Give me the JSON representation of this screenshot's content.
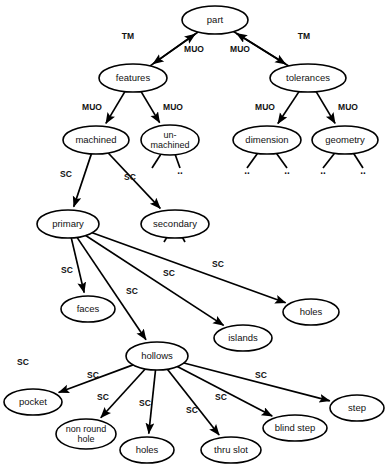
{
  "diagram": {
    "background_color": "#ffffff",
    "stroke_color": "#000000",
    "text_color": "#111111",
    "nodes": [
      {
        "id": "part",
        "label": "part",
        "cx": 215,
        "cy": 20,
        "rx": 33,
        "ry": 14
      },
      {
        "id": "features",
        "label": "features",
        "cx": 133,
        "cy": 78,
        "rx": 34,
        "ry": 14
      },
      {
        "id": "tolerances",
        "label": "tolerances",
        "cx": 308,
        "cy": 78,
        "rx": 38,
        "ry": 14
      },
      {
        "id": "machined",
        "label": "machined",
        "cx": 96,
        "cy": 140,
        "rx": 33,
        "ry": 14
      },
      {
        "id": "unmachined",
        "label": "un-|machined",
        "cx": 170,
        "cy": 140,
        "rx": 29,
        "ry": 15
      },
      {
        "id": "dimension",
        "label": "dimension",
        "cx": 267,
        "cy": 140,
        "rx": 34,
        "ry": 14
      },
      {
        "id": "geometry",
        "label": "geometry",
        "cx": 345,
        "cy": 140,
        "rx": 33,
        "ry": 14
      },
      {
        "id": "primary",
        "label": "primary",
        "cx": 68,
        "cy": 224,
        "rx": 31,
        "ry": 14
      },
      {
        "id": "secondary",
        "label": "secondary",
        "cx": 175,
        "cy": 224,
        "rx": 34,
        "ry": 14
      },
      {
        "id": "faces",
        "label": "faces",
        "cx": 88,
        "cy": 309,
        "rx": 27,
        "ry": 13
      },
      {
        "id": "islands",
        "label": "islands",
        "cx": 243,
        "cy": 338,
        "rx": 29,
        "ry": 13
      },
      {
        "id": "holes_right",
        "label": "holes",
        "cx": 311,
        "cy": 312,
        "rx": 28,
        "ry": 13
      },
      {
        "id": "hollows",
        "label": "hollows",
        "cx": 157,
        "cy": 356,
        "rx": 31,
        "ry": 14
      },
      {
        "id": "pocket",
        "label": "pocket",
        "cx": 33,
        "cy": 402,
        "rx": 29,
        "ry": 13
      },
      {
        "id": "nonround",
        "label": "non round|hole",
        "cx": 86,
        "cy": 434,
        "rx": 30,
        "ry": 15
      },
      {
        "id": "holes_bot",
        "label": "holes",
        "cx": 147,
        "cy": 450,
        "rx": 27,
        "ry": 13
      },
      {
        "id": "thruslot",
        "label": "thru slot",
        "cx": 231,
        "cy": 450,
        "rx": 30,
        "ry": 13
      },
      {
        "id": "blindstep",
        "label": "blind step",
        "cx": 295,
        "cy": 428,
        "rx": 32,
        "ry": 13
      },
      {
        "id": "step",
        "label": "step",
        "cx": 357,
        "cy": 408,
        "rx": 27,
        "ry": 13
      }
    ],
    "edges": [
      {
        "from": "features",
        "to": "part",
        "label": "TM",
        "lx": 128,
        "ly": 37
      },
      {
        "from": "part",
        "to": "features",
        "label": "MUO",
        "lx": 194,
        "ly": 50
      },
      {
        "from": "part",
        "to": "tolerances",
        "label": "MUO",
        "lx": 240,
        "ly": 50
      },
      {
        "from": "tolerances",
        "to": "part",
        "label": "TM",
        "lx": 304,
        "ly": 37
      },
      {
        "from": "features",
        "to": "machined",
        "label": "MUO",
        "lx": 92,
        "ly": 108
      },
      {
        "from": "features",
        "to": "unmachined",
        "label": "MUO",
        "lx": 173,
        "ly": 108
      },
      {
        "from": "tolerances",
        "to": "dimension",
        "label": "MUO",
        "lx": 265,
        "ly": 108
      },
      {
        "from": "tolerances",
        "to": "geometry",
        "label": "MUO",
        "lx": 348,
        "ly": 108
      },
      {
        "from": "machined",
        "to": "primary",
        "label": "SC",
        "lx": 66,
        "ly": 175
      },
      {
        "from": "machined",
        "to": "secondary",
        "label": "SC",
        "lx": 130,
        "ly": 178
      },
      {
        "from": "primary",
        "to": "faces",
        "label": "SC",
        "lx": 67,
        "ly": 271
      },
      {
        "from": "primary",
        "to": "hollows",
        "label": "SC",
        "lx": 132,
        "ly": 292
      },
      {
        "from": "primary",
        "to": "islands",
        "label": "SC",
        "lx": 169,
        "ly": 274
      },
      {
        "from": "primary",
        "to": "holes_right",
        "label": "SC",
        "lx": 218,
        "ly": 265
      },
      {
        "from": "hollows",
        "to": "pocket",
        "label": "SC",
        "lx": 93,
        "ly": 376
      },
      {
        "from": "hollows",
        "to": "nonround",
        "label": "SC",
        "lx": 103,
        "ly": 398
      },
      {
        "from": "hollows",
        "to": "holes_bot",
        "label": "SC",
        "lx": 145,
        "ly": 404
      },
      {
        "from": "hollows",
        "to": "thruslot",
        "label": "SC",
        "lx": 192,
        "ly": 411
      },
      {
        "from": "hollows",
        "to": "blindstep",
        "label": "SC",
        "lx": 221,
        "ly": 398
      },
      {
        "from": "hollows",
        "to": "step",
        "label": "SC",
        "lx": 261,
        "ly": 376
      }
    ],
    "loose_labels": [
      {
        "text": "SC",
        "x": 23,
        "y": 363
      }
    ],
    "leaf_stubs": [
      {
        "from": "unmachined",
        "dx": -18,
        "dy": 28,
        "dots": false
      },
      {
        "from": "unmachined",
        "dx": 10,
        "dy": 28,
        "dots": true
      },
      {
        "from": "dimension",
        "dx": -20,
        "dy": 28,
        "dots": true
      },
      {
        "from": "dimension",
        "dx": 20,
        "dy": 28,
        "dots": true
      },
      {
        "from": "geometry",
        "dx": -22,
        "dy": 28,
        "dots": true
      },
      {
        "from": "geometry",
        "dx": 18,
        "dy": 28,
        "dots": true
      },
      {
        "from": "secondary",
        "dx": -11,
        "dy": 18,
        "dots": false
      },
      {
        "from": "secondary",
        "dx": 10,
        "dy": 18,
        "dots": false
      }
    ],
    "relation_types": {
      "TM": "type member",
      "MUO": "must use one",
      "SC": "subclass"
    }
  }
}
